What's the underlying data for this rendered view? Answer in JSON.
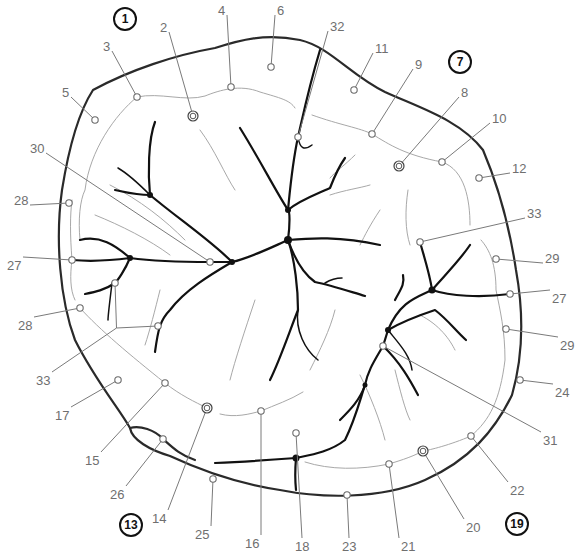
{
  "diagram": {
    "type": "tooth-occlusal-surface-landmarks",
    "cusp_markers": [
      {
        "id": "1",
        "x": 125,
        "y": 19
      },
      {
        "id": "7",
        "x": 460,
        "y": 62
      },
      {
        "id": "13",
        "x": 131,
        "y": 525
      },
      {
        "id": "19",
        "x": 517,
        "y": 524
      }
    ],
    "labels": [
      {
        "text": "2",
        "x": 160,
        "y": 27,
        "px": 193,
        "py": 116,
        "double": true
      },
      {
        "text": "3",
        "x": 103,
        "y": 46,
        "px": 137,
        "py": 97
      },
      {
        "text": "4",
        "x": 218,
        "y": 10,
        "px": 231,
        "py": 87
      },
      {
        "text": "5",
        "x": 62,
        "y": 92,
        "px": 95,
        "py": 120
      },
      {
        "text": "6",
        "x": 277,
        "y": 10,
        "px": 271,
        "py": 67
      },
      {
        "text": "32",
        "x": 330,
        "y": 26,
        "px": 298,
        "py": 137
      },
      {
        "text": "11",
        "x": 375,
        "y": 48,
        "px": 354,
        "py": 90
      },
      {
        "text": "9",
        "x": 415,
        "y": 64,
        "px": 372,
        "py": 134
      },
      {
        "text": "8",
        "x": 461,
        "y": 92,
        "px": 399,
        "py": 166,
        "double": true
      },
      {
        "text": "10",
        "x": 492,
        "y": 118,
        "px": 442,
        "py": 162
      },
      {
        "text": "12",
        "x": 512,
        "y": 168,
        "px": 479,
        "py": 178
      },
      {
        "text": "30",
        "x": 30,
        "y": 148,
        "px": 210,
        "py": 262
      },
      {
        "text": "28",
        "x": 14,
        "y": 200,
        "px": 69,
        "py": 203
      },
      {
        "text": "33",
        "x": 527,
        "y": 213,
        "px": 420,
        "py": 242
      },
      {
        "text": "27",
        "x": 7,
        "y": 265,
        "px": 72,
        "py": 260
      },
      {
        "text": "29",
        "x": 545,
        "y": 258,
        "px": 496,
        "py": 259
      },
      {
        "text": "27",
        "x": 552,
        "y": 298,
        "px": 510,
        "py": 294
      },
      {
        "text": "28",
        "x": 18,
        "y": 325,
        "px": 80,
        "py": 308
      },
      {
        "text": "29",
        "x": 560,
        "y": 345,
        "px": 506,
        "py": 329
      },
      {
        "text": "33",
        "x": 36,
        "y": 380,
        "px": 115,
        "py": 283,
        "px2": 158,
        "py2": 326
      },
      {
        "text": "17",
        "x": 55,
        "y": 415,
        "px": 118,
        "py": 380
      },
      {
        "text": "24",
        "x": 555,
        "y": 392,
        "px": 520,
        "py": 380
      },
      {
        "text": "31",
        "x": 543,
        "y": 440,
        "px": 383,
        "py": 346
      },
      {
        "text": "15",
        "x": 85,
        "y": 460,
        "px": 165,
        "py": 383
      },
      {
        "text": "26",
        "x": 110,
        "y": 494,
        "px": 163,
        "py": 439
      },
      {
        "text": "22",
        "x": 510,
        "y": 490,
        "px": 471,
        "py": 436
      },
      {
        "text": "14",
        "x": 152,
        "y": 518,
        "px": 207,
        "py": 408,
        "double": true
      },
      {
        "text": "25",
        "x": 195,
        "y": 534,
        "px": 213,
        "py": 479
      },
      {
        "text": "16",
        "x": 245,
        "y": 543,
        "px": 261,
        "py": 411
      },
      {
        "text": "18",
        "x": 295,
        "y": 546,
        "px": 296,
        "py": 433
      },
      {
        "text": "23",
        "x": 342,
        "y": 546,
        "px": 347,
        "py": 495
      },
      {
        "text": "21",
        "x": 401,
        "y": 546,
        "px": 389,
        "py": 464
      },
      {
        "text": "20",
        "x": 466,
        "y": 527,
        "px": 423,
        "py": 451,
        "double": true
      }
    ]
  }
}
